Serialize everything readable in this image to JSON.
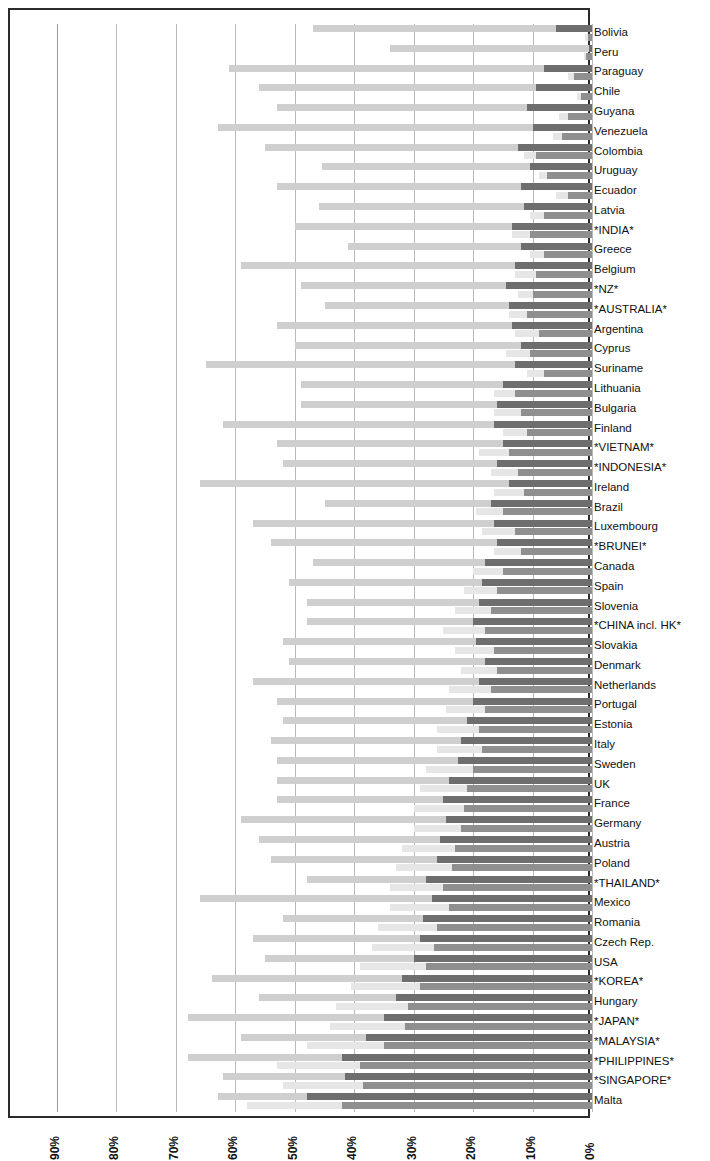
{
  "legend": {
    "items": [
      {
        "label": "Export: machinery P&C",
        "color": "#6e6e6e",
        "name": "legend-export-pc"
      },
      {
        "label": "Export: machinery FP",
        "color": "#cfcfcf",
        "name": "legend-export-fp"
      },
      {
        "label": "Import: machinery P&C",
        "color": "#8f8f8f",
        "name": "legend-import-pc"
      },
      {
        "label": "Import: machinery FP",
        "color": "#e6e6e6",
        "name": "legend-import-fp"
      }
    ]
  },
  "axis": {
    "x_ticks": [
      "90%",
      "80%",
      "70%",
      "60%",
      "50%",
      "40%",
      "30%",
      "20%",
      "10%",
      "0%"
    ],
    "x_min": 0,
    "x_max": 90,
    "reversed": true
  },
  "chart_data": {
    "type": "bar",
    "title": "",
    "subtitle": "",
    "xlabel": "",
    "ylabel": "",
    "orientation": "horizontal",
    "stacked": true,
    "reversed_x_axis": true,
    "xlim": [
      0,
      90
    ],
    "x_tick_labels": [
      "90%",
      "80%",
      "70%",
      "60%",
      "50%",
      "40%",
      "30%",
      "20%",
      "10%",
      "0%"
    ],
    "grid": true,
    "legend_position": "left-rotated",
    "series": [
      {
        "name": "Export: machinery P&C",
        "color": "#6e6e6e"
      },
      {
        "name": "Export: machinery FP",
        "color": "#cfcfcf"
      },
      {
        "name": "Import: machinery P&C",
        "color": "#8f8f8f"
      },
      {
        "name": "Import: machinery FP",
        "color": "#e6e6e6"
      }
    ],
    "categories": [
      "Bolivia",
      "Peru",
      "Paraguay",
      "Chile",
      "Guyana",
      "Venezuela",
      "Colombia",
      "Uruguay",
      "Ecuador",
      "Latvia",
      "*INDIA*",
      "Greece",
      "Belgium",
      "*NZ*",
      "*AUSTRALIA*",
      "Argentina",
      "Cyprus",
      "Suriname",
      "Lithuania",
      "Bulgaria",
      "Finland",
      "*VIETNAM*",
      "*INDONESIA*",
      "Ireland",
      "Brazil",
      "Luxembourg",
      "*BRUNEI*",
      "Canada",
      "Spain",
      "Slovenia",
      "*CHINA incl. HK*",
      "Slovakia",
      "Denmark",
      "Netherlands",
      "Portugal",
      "Estonia",
      "Italy",
      "Sweden",
      "UK",
      "France",
      "Germany",
      "Austria",
      "Poland",
      "*THAILAND*",
      "Mexico",
      "Romania",
      "Czech Rep.",
      "USA",
      "*KOREA*",
      "Hungary",
      "*JAPAN*",
      "*MALAYSIA*",
      "*PHILIPPINES*",
      "*SINGAPORE*",
      "Malta"
    ],
    "rows": [
      {
        "country": "Bolivia",
        "export_pc": 6.0,
        "export_fp": 41.0,
        "import_pc": 0.6,
        "import_fp": 0.5
      },
      {
        "country": "Peru",
        "export_pc": 0.5,
        "export_fp": 33.5,
        "import_pc": 1.0,
        "import_fp": 0.4
      },
      {
        "country": "Paraguay",
        "export_pc": 8.0,
        "export_fp": 53.0,
        "import_pc": 3.0,
        "import_fp": 1.0
      },
      {
        "country": "Chile",
        "export_pc": 9.5,
        "export_fp": 46.5,
        "import_pc": 1.8,
        "import_fp": 0.8
      },
      {
        "country": "Guyana",
        "export_pc": 11.0,
        "export_fp": 42.0,
        "import_pc": 4.0,
        "import_fp": 1.5
      },
      {
        "country": "Venezuela",
        "export_pc": 10.0,
        "export_fp": 53.0,
        "import_pc": 5.0,
        "import_fp": 1.5
      },
      {
        "country": "Colombia",
        "export_pc": 12.5,
        "export_fp": 42.5,
        "import_pc": 9.5,
        "import_fp": 2.0
      },
      {
        "country": "Uruguay",
        "export_pc": 10.5,
        "export_fp": 35.0,
        "import_pc": 7.5,
        "import_fp": 1.5
      },
      {
        "country": "Ecuador",
        "export_pc": 12.0,
        "export_fp": 41.0,
        "import_pc": 4.0,
        "import_fp": 2.0
      },
      {
        "country": "Latvia",
        "export_pc": 11.5,
        "export_fp": 34.5,
        "import_pc": 8.0,
        "import_fp": 2.5
      },
      {
        "country": "*INDIA*",
        "export_pc": 13.5,
        "export_fp": 36.5,
        "import_pc": 10.5,
        "import_fp": 3.0
      },
      {
        "country": "Greece",
        "export_pc": 12.0,
        "export_fp": 29.0,
        "import_pc": 8.0,
        "import_fp": 2.5
      },
      {
        "country": "Belgium",
        "export_pc": 13.0,
        "export_fp": 46.0,
        "import_pc": 9.5,
        "import_fp": 3.5
      },
      {
        "country": "*NZ*",
        "export_pc": 14.5,
        "export_fp": 34.5,
        "import_pc": 10.0,
        "import_fp": 2.5
      },
      {
        "country": "*AUSTRALIA*",
        "export_pc": 14.0,
        "export_fp": 31.0,
        "import_pc": 11.0,
        "import_fp": 3.0
      },
      {
        "country": "Argentina",
        "export_pc": 13.5,
        "export_fp": 39.5,
        "import_pc": 9.0,
        "import_fp": 4.0
      },
      {
        "country": "Cyprus",
        "export_pc": 12.0,
        "export_fp": 38.0,
        "import_pc": 10.5,
        "import_fp": 4.0
      },
      {
        "country": "Suriname",
        "export_pc": 13.0,
        "export_fp": 52.0,
        "import_pc": 8.0,
        "import_fp": 3.0
      },
      {
        "country": "Lithuania",
        "export_pc": 15.0,
        "export_fp": 34.0,
        "import_pc": 13.0,
        "import_fp": 3.5
      },
      {
        "country": "Bulgaria",
        "export_pc": 16.0,
        "export_fp": 33.0,
        "import_pc": 12.0,
        "import_fp": 4.5
      },
      {
        "country": "Finland",
        "export_pc": 16.5,
        "export_fp": 45.5,
        "import_pc": 11.0,
        "import_fp": 4.0
      },
      {
        "country": "*VIETNAM*",
        "export_pc": 15.0,
        "export_fp": 38.0,
        "import_pc": 14.0,
        "import_fp": 5.0
      },
      {
        "country": "*INDONESIA*",
        "export_pc": 16.0,
        "export_fp": 36.0,
        "import_pc": 12.5,
        "import_fp": 4.5
      },
      {
        "country": "Ireland",
        "export_pc": 14.0,
        "export_fp": 52.0,
        "import_pc": 11.5,
        "import_fp": 5.0
      },
      {
        "country": "Brazil",
        "export_pc": 17.0,
        "export_fp": 28.0,
        "import_pc": 15.0,
        "import_fp": 4.5
      },
      {
        "country": "Luxembourg",
        "export_pc": 16.5,
        "export_fp": 40.5,
        "import_pc": 13.0,
        "import_fp": 5.5
      },
      {
        "country": "*BRUNEI*",
        "export_pc": 16.0,
        "export_fp": 38.0,
        "import_pc": 12.0,
        "import_fp": 4.5
      },
      {
        "country": "Canada",
        "export_pc": 18.0,
        "export_fp": 29.0,
        "import_pc": 15.0,
        "import_fp": 5.0
      },
      {
        "country": "Spain",
        "export_pc": 18.5,
        "export_fp": 32.5,
        "import_pc": 16.0,
        "import_fp": 5.5
      },
      {
        "country": "Slovenia",
        "export_pc": 19.0,
        "export_fp": 29.0,
        "import_pc": 17.0,
        "import_fp": 6.0
      },
      {
        "country": "*CHINA incl. HK*",
        "export_pc": 20.0,
        "export_fp": 28.0,
        "import_pc": 18.0,
        "import_fp": 7.0
      },
      {
        "country": "Slovakia",
        "export_pc": 19.5,
        "export_fp": 32.5,
        "import_pc": 16.5,
        "import_fp": 6.5
      },
      {
        "country": "Denmark",
        "export_pc": 18.0,
        "export_fp": 33.0,
        "import_pc": 16.0,
        "import_fp": 6.0
      },
      {
        "country": "Netherlands",
        "export_pc": 19.0,
        "export_fp": 38.0,
        "import_pc": 17.0,
        "import_fp": 7.0
      },
      {
        "country": "Portugal",
        "export_pc": 20.0,
        "export_fp": 33.0,
        "import_pc": 18.0,
        "import_fp": 6.5
      },
      {
        "country": "Estonia",
        "export_pc": 21.0,
        "export_fp": 31.0,
        "import_pc": 19.0,
        "import_fp": 7.0
      },
      {
        "country": "Italy",
        "export_pc": 22.0,
        "export_fp": 32.0,
        "import_pc": 18.5,
        "import_fp": 7.5
      },
      {
        "country": "Sweden",
        "export_pc": 22.5,
        "export_fp": 30.5,
        "import_pc": 20.0,
        "import_fp": 8.0
      },
      {
        "country": "UK",
        "export_pc": 24.0,
        "export_fp": 29.0,
        "import_pc": 21.0,
        "import_fp": 8.0
      },
      {
        "country": "France",
        "export_pc": 25.0,
        "export_fp": 28.0,
        "import_pc": 21.5,
        "import_fp": 8.5
      },
      {
        "country": "Germany",
        "export_pc": 24.5,
        "export_fp": 34.5,
        "import_pc": 22.0,
        "import_fp": 8.0
      },
      {
        "country": "Austria",
        "export_pc": 25.5,
        "export_fp": 30.5,
        "import_pc": 23.0,
        "import_fp": 9.0
      },
      {
        "country": "Poland",
        "export_pc": 26.0,
        "export_fp": 28.0,
        "import_pc": 23.5,
        "import_fp": 9.5
      },
      {
        "country": "*THAILAND*",
        "export_pc": 28.0,
        "export_fp": 20.0,
        "import_pc": 25.0,
        "import_fp": 9.0
      },
      {
        "country": "Mexico",
        "export_pc": 27.0,
        "export_fp": 39.0,
        "import_pc": 24.0,
        "import_fp": 10.0
      },
      {
        "country": "Romania",
        "export_pc": 28.5,
        "export_fp": 23.5,
        "import_pc": 26.0,
        "import_fp": 10.0
      },
      {
        "country": "Czech Rep.",
        "export_pc": 29.0,
        "export_fp": 28.0,
        "import_pc": 26.5,
        "import_fp": 10.5
      },
      {
        "country": "USA",
        "export_pc": 30.0,
        "export_fp": 25.0,
        "import_pc": 28.0,
        "import_fp": 11.0
      },
      {
        "country": "*KOREA*",
        "export_pc": 32.0,
        "export_fp": 32.0,
        "import_pc": 29.0,
        "import_fp": 11.5
      },
      {
        "country": "Hungary",
        "export_pc": 33.0,
        "export_fp": 23.0,
        "import_pc": 31.0,
        "import_fp": 12.0
      },
      {
        "country": "*JAPAN*",
        "export_pc": 35.0,
        "export_fp": 33.0,
        "import_pc": 31.5,
        "import_fp": 12.5
      },
      {
        "country": "*MALAYSIA*",
        "export_pc": 38.0,
        "export_fp": 21.0,
        "import_pc": 35.0,
        "import_fp": 13.0
      },
      {
        "country": "*PHILIPPINES*",
        "export_pc": 42.0,
        "export_fp": 26.0,
        "import_pc": 39.0,
        "import_fp": 14.0
      },
      {
        "country": "*SINGAPORE*",
        "export_pc": 41.5,
        "export_fp": 20.5,
        "import_pc": 38.5,
        "import_fp": 13.5
      },
      {
        "country": "Malta",
        "export_pc": 48.0,
        "export_fp": 15.0,
        "import_pc": 42.0,
        "import_fp": 16.0
      }
    ]
  }
}
